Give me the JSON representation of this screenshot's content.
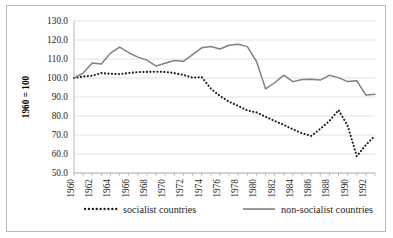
{
  "chart_data": {
    "type": "line",
    "title": "",
    "xlabel": "",
    "ylabel": "1960 = 100",
    "ylim": [
      50.0,
      130.0
    ],
    "ytick_labels": [
      "130.0",
      "120.0",
      "110.0",
      "100.0",
      "90.0",
      "80.0",
      "70.0",
      "60.0",
      "50.0"
    ],
    "ytick_values": [
      130.0,
      120.0,
      110.0,
      100.0,
      90.0,
      80.0,
      70.0,
      60.0,
      50.0
    ],
    "grid": true,
    "legend_position": "bottom",
    "x": [
      1960,
      1961,
      1962,
      1963,
      1964,
      1965,
      1966,
      1967,
      1968,
      1969,
      1970,
      1971,
      1972,
      1973,
      1974,
      1975,
      1976,
      1977,
      1978,
      1979,
      1980,
      1981,
      1982,
      1983,
      1984,
      1985,
      1986,
      1987,
      1988,
      1989,
      1990,
      1991,
      1992,
      1993
    ],
    "xtick_labels": [
      "1960",
      "1962",
      "1964",
      "1966",
      "1968",
      "1970",
      "1972",
      "1974",
      "1976",
      "1978",
      "1980",
      "1982",
      "1984",
      "1986",
      "1988",
      "1990",
      "1992"
    ],
    "xlim": [
      1960,
      1993
    ],
    "series": [
      {
        "name": "socialist countries",
        "style": "dotted",
        "color": "#1a1a1a",
        "values": [
          100.0,
          100.8,
          101.2,
          102.6,
          102.2,
          102.1,
          102.6,
          103.1,
          103.2,
          103.3,
          103.2,
          102.6,
          101.6,
          100.2,
          100.5,
          94.4,
          90.6,
          87.5,
          85.3,
          82.9,
          81.9,
          79.6,
          77.4,
          75.3,
          73.0,
          70.9,
          69.5,
          73.2,
          77.4,
          83.1,
          75.0,
          58.8,
          64.8,
          69.6
        ]
      },
      {
        "name": "non-socialist countries",
        "style": "solid",
        "color": "#808080",
        "values": [
          100.0,
          102.6,
          107.9,
          107.4,
          113.1,
          116.3,
          113.3,
          111.0,
          109.4,
          106.3,
          107.8,
          109.2,
          108.8,
          112.3,
          115.9,
          116.6,
          115.3,
          117.2,
          117.8,
          116.5,
          108.8,
          94.3,
          97.5,
          101.5,
          98.1,
          99.2,
          99.4,
          98.9,
          101.4,
          100.2,
          98.1,
          98.6,
          91.0,
          91.5
        ]
      }
    ],
    "series_extra_note": ""
  },
  "legend": {
    "items": [
      {
        "label": "socialist countries",
        "style": "dotted"
      },
      {
        "label": "non-socialist countries",
        "style": "solid"
      }
    ]
  }
}
